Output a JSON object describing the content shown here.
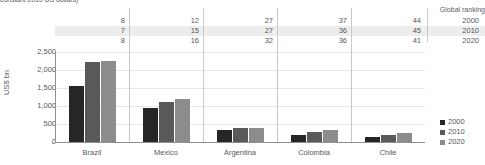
{
  "caption": "constant 2010 US dollars)",
  "ranking_table": {
    "header": "Global ranking",
    "years": [
      "2000",
      "2010",
      "2020"
    ],
    "countries": [
      "Brazil",
      "Mexico",
      "Argentina",
      "Colombia",
      "Chile"
    ],
    "rows": [
      {
        "year": "2000",
        "values": [
          "8",
          "12",
          "27",
          "37",
          "44"
        ]
      },
      {
        "year": "2010",
        "values": [
          "7",
          "15",
          "27",
          "36",
          "45"
        ]
      },
      {
        "year": "2020",
        "values": [
          "8",
          "16",
          "32",
          "36",
          "41"
        ]
      }
    ]
  },
  "legend": {
    "items": [
      {
        "label": "2000",
        "color": "#262626"
      },
      {
        "label": "2010",
        "color": "#595959"
      },
      {
        "label": "2020",
        "color": "#8c8c8c"
      }
    ]
  },
  "chart_data": {
    "type": "bar",
    "title": "",
    "xlabel": "",
    "ylabel": "US$ bn",
    "ylim": [
      0,
      2500
    ],
    "yticks": [
      0,
      500,
      1000,
      1500,
      2000,
      2500
    ],
    "ytick_labels": [
      "0",
      "500",
      "1,000",
      "1,500",
      "2,000",
      "2,500"
    ],
    "grid": true,
    "legend_position": "right",
    "categories": [
      "Brazil",
      "Mexico",
      "Argentina",
      "Colombia",
      "Chile"
    ],
    "series": [
      {
        "name": "2000",
        "color": "#262626",
        "values": [
          1550,
          950,
          320,
          200,
          130
        ]
      },
      {
        "name": "2010",
        "color": "#595959",
        "values": [
          2220,
          1100,
          400,
          270,
          200
        ]
      },
      {
        "name": "2020",
        "color": "#8c8c8c",
        "values": [
          2250,
          1200,
          390,
          320,
          250
        ]
      }
    ]
  }
}
